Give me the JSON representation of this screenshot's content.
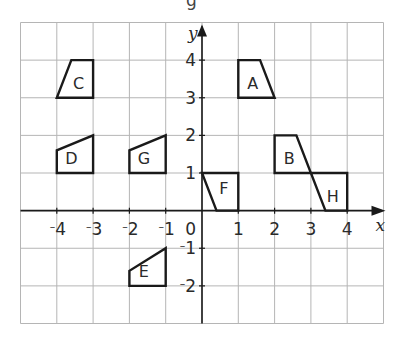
{
  "header": {
    "cropped_text": "g"
  },
  "axes": {
    "x_label": "x",
    "y_label": "y",
    "x_range": [
      -5,
      5
    ],
    "y_range": [
      -3,
      5
    ],
    "x_tick_values": [
      -4,
      -3,
      -2,
      -1,
      1,
      2,
      3,
      4
    ],
    "y_tick_values": [
      4,
      3,
      2,
      1,
      -1,
      -2
    ],
    "origin_label": "0"
  },
  "shapes": [
    {
      "label": "A",
      "points": [
        [
          1,
          3
        ],
        [
          1,
          4
        ],
        [
          1.6,
          4
        ],
        [
          2,
          3
        ]
      ],
      "label_at": [
        1.4,
        3.4
      ]
    },
    {
      "label": "B",
      "points": [
        [
          2,
          1
        ],
        [
          2,
          2
        ],
        [
          2.6,
          2
        ],
        [
          3,
          1
        ]
      ],
      "label_at": [
        2.4,
        1.4
      ]
    },
    {
      "label": "C",
      "points": [
        [
          -4,
          3
        ],
        [
          -3,
          3
        ],
        [
          -3,
          4
        ],
        [
          -3.6,
          4
        ]
      ],
      "label_at": [
        -3.4,
        3.4
      ]
    },
    {
      "label": "D",
      "points": [
        [
          -4,
          1
        ],
        [
          -3,
          1
        ],
        [
          -3,
          2
        ],
        [
          -4,
          1.6
        ]
      ],
      "label_at": [
        -3.6,
        1.4
      ]
    },
    {
      "label": "E",
      "points": [
        [
          -2,
          -2
        ],
        [
          -1,
          -2
        ],
        [
          -1,
          -1
        ],
        [
          -2,
          -1.6
        ]
      ],
      "label_at": [
        -1.6,
        -1.6
      ]
    },
    {
      "label": "F",
      "points": [
        [
          0,
          1
        ],
        [
          1,
          1
        ],
        [
          1,
          0
        ],
        [
          0.4,
          0
        ]
      ],
      "label_at": [
        0.6,
        0.6
      ]
    },
    {
      "label": "G",
      "points": [
        [
          -2,
          1
        ],
        [
          -1,
          1
        ],
        [
          -1,
          2
        ],
        [
          -2,
          1.6
        ]
      ],
      "label_at": [
        -1.6,
        1.4
      ]
    },
    {
      "label": "H",
      "points": [
        [
          3,
          1
        ],
        [
          4,
          1
        ],
        [
          4,
          0
        ],
        [
          3.4,
          0
        ]
      ],
      "label_at": [
        3.6,
        0.4
      ]
    }
  ]
}
